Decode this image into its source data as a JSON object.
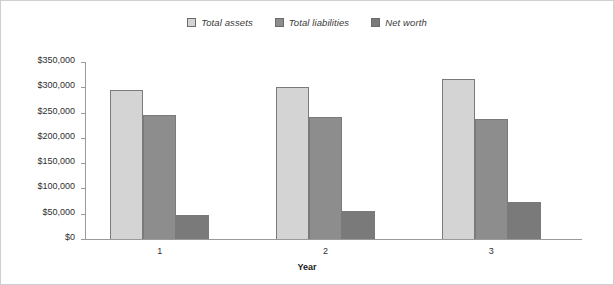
{
  "chart_data": {
    "type": "bar",
    "title": "",
    "xlabel": "Year",
    "ylabel": "",
    "categories": [
      "1",
      "2",
      "3"
    ],
    "series": [
      {
        "name": "Total assets",
        "color": "#d4d4d4",
        "values": [
          295000,
          300000,
          317000
        ]
      },
      {
        "name": "Total liabilities",
        "color": "#8d8d8d",
        "values": [
          245000,
          242000,
          238000
        ]
      },
      {
        "name": "Net worth",
        "color": "#7a7a7a",
        "values": [
          47000,
          55000,
          73000
        ]
      }
    ],
    "ylim": [
      0,
      350000
    ],
    "ytick_values": [
      350000,
      300000,
      250000,
      200000,
      150000,
      100000,
      50000,
      0
    ],
    "ytick_labels": [
      "$350,000",
      "$300,000",
      "$250,000",
      "$200,000",
      "$150,000",
      "$100,000",
      "$50,000",
      "$0"
    ],
    "grid": false,
    "legend_position": "top-center"
  }
}
